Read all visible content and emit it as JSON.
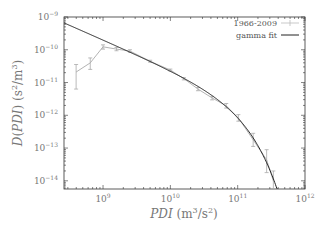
{
  "chart_data": {
    "type": "line",
    "title": "",
    "xlabel": "PDI (m³/s²)",
    "ylabel": "D(PDI) (s²/m³)",
    "xscale": "log",
    "yscale": "log",
    "xlim_log10": [
      8.42,
      12
    ],
    "ylim_log10": [
      -14.25,
      -9
    ],
    "x_tick_labels": [
      {
        "exp": 9,
        "base": "10",
        "sup": "9"
      },
      {
        "exp": 10,
        "base": "10",
        "sup": "10"
      },
      {
        "exp": 11,
        "base": "10",
        "sup": "11"
      },
      {
        "exp": 12,
        "base": "10",
        "sup": "12"
      }
    ],
    "y_tick_labels": [
      {
        "exp": -9,
        "base": "10",
        "sup": "−9"
      },
      {
        "exp": -10,
        "base": "10",
        "sup": "−10"
      },
      {
        "exp": -11,
        "base": "10",
        "sup": "−11"
      },
      {
        "exp": -12,
        "base": "10",
        "sup": "−12"
      },
      {
        "exp": -13,
        "base": "10",
        "sup": "−13"
      },
      {
        "exp": -14,
        "base": "10",
        "sup": "−14"
      }
    ],
    "legend": {
      "placement": "top-right",
      "entries": [
        "1966-2009",
        "gamma fit"
      ]
    },
    "series": [
      {
        "name": "1966-2009",
        "style": "gray line with error bars",
        "color": "#aaaaaa",
        "points_log10": [
          {
            "x": 8.6,
            "y": -10.68,
            "err_lo": -11.2,
            "err_hi": -10.45
          },
          {
            "x": 8.81,
            "y": -10.4,
            "err_lo": -10.6,
            "err_hi": -10.25
          },
          {
            "x": 9.0,
            "y": -9.91,
            "err_lo": -9.98,
            "err_hi": -9.85
          },
          {
            "x": 9.2,
            "y": -9.98,
            "err_lo": -10.03,
            "err_hi": -9.93
          },
          {
            "x": 9.4,
            "y": -10.04,
            "err_lo": -10.08,
            "err_hi": -10.0
          },
          {
            "x": 9.7,
            "y": -10.35,
            "err_lo": -10.38,
            "err_hi": -10.32
          },
          {
            "x": 10.0,
            "y": -10.62,
            "err_lo": -10.65,
            "err_hi": -10.59
          },
          {
            "x": 10.2,
            "y": -10.88,
            "err_lo": -10.92,
            "err_hi": -10.85
          },
          {
            "x": 10.41,
            "y": -11.2,
            "err_lo": -11.25,
            "err_hi": -11.15
          },
          {
            "x": 10.62,
            "y": -11.47,
            "err_lo": -11.53,
            "err_hi": -11.42
          },
          {
            "x": 10.83,
            "y": -11.71,
            "err_lo": -11.78,
            "err_hi": -11.64
          },
          {
            "x": 11.01,
            "y": -12.08,
            "err_lo": -12.18,
            "err_hi": -11.98
          },
          {
            "x": 11.23,
            "y": -12.75,
            "err_lo": -12.95,
            "err_hi": -12.55
          },
          {
            "x": 11.43,
            "y": -13.36,
            "err_lo": -13.75,
            "err_hi": -13.05
          },
          {
            "x": 11.53,
            "y": -14.0,
            "err_lo": -14.25,
            "err_hi": -13.7
          }
        ]
      },
      {
        "name": "gamma fit",
        "style": "black solid line",
        "color": "#222222",
        "model": "D = A·x^(−a)·exp(−x/b)",
        "params": {
          "log10_A_at_xmin": -9.18,
          "a": 0.9,
          "b": 75000000000.0,
          "x_min_log10": 8.42
        }
      }
    ],
    "grid": false
  }
}
